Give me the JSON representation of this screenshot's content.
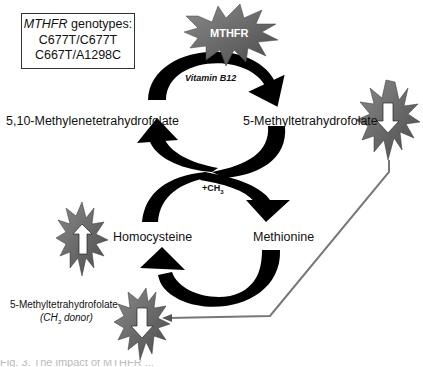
{
  "genotype_box": {
    "title_italic": "MTHFR",
    "title_rest": " genotypes:",
    "line1": "C677T/C677T",
    "line2": "C667T/A1298C"
  },
  "enzyme_badge": {
    "label": "MTHFR"
  },
  "cofactor": {
    "label": "Vitamin B12"
  },
  "nodes": {
    "top_left": "5,10-Methylenetetrahydrofolate",
    "top_right": "5-Methyltetrahydrofolate",
    "bottom_left": "Homocysteine",
    "bottom_right": "Methionine"
  },
  "methyl_transfer": {
    "prefix": "+CH",
    "subscript": "3"
  },
  "side_note": {
    "line1": "5-Methyltetrahydrofolate",
    "line2_prefix": "(CH",
    "line2_sub": "3",
    "line2_suffix": " donor)"
  },
  "indicators": [
    {
      "id": "right",
      "direction": "down",
      "meaning": "decreased"
    },
    {
      "id": "left",
      "direction": "up",
      "meaning": "increased"
    },
    {
      "id": "bottom",
      "direction": "down",
      "meaning": "decreased"
    }
  ],
  "colors": {
    "arrow": "#000000",
    "starburst": "#6b6b6b",
    "starburst_dark": "#4a4a4a",
    "connector": "#777777"
  },
  "caption_partial": "Fig. 3. The impact of MTHFR ..."
}
